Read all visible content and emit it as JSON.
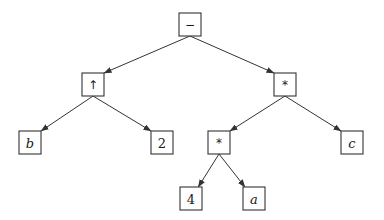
{
  "diagram": {
    "type": "expression-tree",
    "box_size": {
      "w": 22,
      "h": 23
    },
    "colors": {
      "stroke": "#333333",
      "background": "#ffffff",
      "text": "#1a1a1a"
    },
    "nodes": [
      {
        "id": "root",
        "label": "−",
        "style": "op",
        "cx": 190,
        "y": 13
      },
      {
        "id": "pow",
        "label": "↑",
        "style": "op",
        "cx": 93,
        "y": 73
      },
      {
        "id": "mulR",
        "label": "*",
        "style": "op",
        "cx": 285,
        "y": 73
      },
      {
        "id": "b",
        "label": "b",
        "style": "italic",
        "cx": 30,
        "y": 131
      },
      {
        "id": "two",
        "label": "2",
        "style": "plain",
        "cx": 162,
        "y": 131
      },
      {
        "id": "mulM",
        "label": "*",
        "style": "op",
        "cx": 219,
        "y": 131
      },
      {
        "id": "c",
        "label": "c",
        "style": "italic",
        "cx": 352,
        "y": 131
      },
      {
        "id": "four",
        "label": "4",
        "style": "plain",
        "cx": 191,
        "y": 187
      },
      {
        "id": "a",
        "label": "a",
        "style": "italic",
        "cx": 254,
        "y": 187
      }
    ],
    "edges": [
      {
        "from": "root",
        "to": "pow"
      },
      {
        "from": "root",
        "to": "mulR"
      },
      {
        "from": "pow",
        "to": "b"
      },
      {
        "from": "pow",
        "to": "two"
      },
      {
        "from": "mulR",
        "to": "mulM"
      },
      {
        "from": "mulR",
        "to": "c"
      },
      {
        "from": "mulM",
        "to": "four"
      },
      {
        "from": "mulM",
        "to": "a"
      }
    ],
    "expression": "b ↑ 2 − (4 * a) * c"
  }
}
